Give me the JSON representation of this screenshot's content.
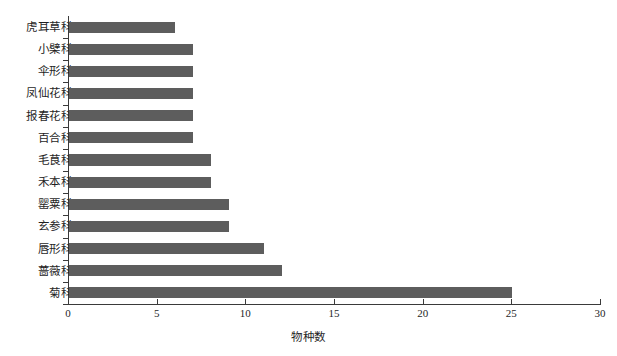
{
  "chart_data": {
    "type": "bar",
    "orientation": "horizontal",
    "title": "",
    "xlabel": "物种数",
    "ylabel": "",
    "xlim": [
      0,
      30
    ],
    "xticks": [
      0,
      5,
      10,
      15,
      20,
      25,
      30
    ],
    "xtick_labels": [
      "0",
      "5",
      "10",
      "15",
      "20",
      "25",
      "30"
    ],
    "grid": false,
    "legend": false,
    "bar_color": "#5d5d5d",
    "axis_color": "#3a3a3a",
    "background_color": "#ffffff",
    "categories": [
      "虎耳草科",
      "小檗科",
      "伞形科",
      "凤仙花科",
      "报春花科",
      "百合科",
      "毛茛科",
      "禾本科",
      "罂粟科",
      "玄参科",
      "唇形科",
      "蔷薇科",
      "菊科"
    ],
    "values": [
      6,
      7,
      7,
      7,
      7,
      7,
      8,
      8,
      9,
      9,
      11,
      12,
      25
    ]
  }
}
